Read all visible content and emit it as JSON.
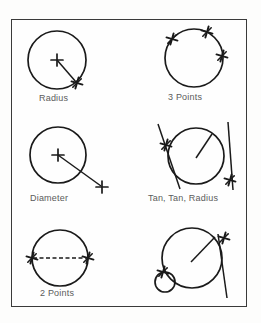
{
  "page": {
    "border_color": "#3a3a3a",
    "ink_color": "#1a1a1a",
    "label_color": "#5b5b5b",
    "background": "#fefefe"
  },
  "figures": [
    {
      "id": "radius",
      "label": "Radius",
      "description": "Circle defined by center point and radius point",
      "markers": [
        "center-plus",
        "radius-endpoint-star"
      ],
      "line_style": "solid"
    },
    {
      "id": "three-points",
      "label": "3 Points",
      "description": "Circle defined by three points on circumference",
      "markers": [
        "point-star-upper-left",
        "point-star-top",
        "point-star-right"
      ],
      "line_style": "none"
    },
    {
      "id": "diameter",
      "label": "Diameter",
      "description": "Circle defined by center point and diameter point outside",
      "markers": [
        "center-plus",
        "diameter-endpoint-plus"
      ],
      "line_style": "solid"
    },
    {
      "id": "tan-tan-radius",
      "label": "Tan, Tan, Radius",
      "description": "Circle tangent to two lines with given radius",
      "markers": [
        "tangent-star-left",
        "tangent-star-right"
      ],
      "line_style": "solid"
    },
    {
      "id": "two-points",
      "label": "2 Points",
      "description": "Circle defined by two diameter endpoints",
      "markers": [
        "point-star-left",
        "point-star-right"
      ],
      "line_style": "dashed"
    },
    {
      "id": "tan-tan-tan",
      "label": "",
      "description": "Circle tangent to a small circle and a line",
      "markers": [
        "tangent-star-circle",
        "tangent-star-line"
      ],
      "line_style": "solid"
    }
  ],
  "captions": {
    "radius": "Radius",
    "three_points": "3 Points",
    "diameter": "Diameter",
    "tan_tan_radius": "Tan, Tan, Radius",
    "two_points": "2 Points"
  }
}
